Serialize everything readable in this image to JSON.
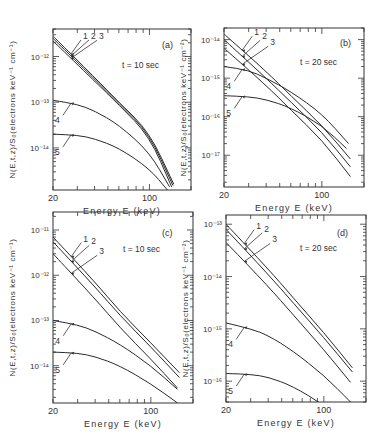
{
  "figure": {
    "ylabel": "N(E,t,z)/S₀(electrons keV⁻¹ cm⁻¹)",
    "ylabel_right": "N(E,t,z)/S₀(electrons keV⁻¹ cm⁻²)",
    "ylabel_c": "N(E,t,z)/S₀(elect",
    "ylabel_d": "N(E,t,z)/S₀(elec"
  },
  "chart_data": [
    {
      "type": "line",
      "panel": "(a)",
      "annotation": "t = 10 sec",
      "xlabel": "Energy E (keV)",
      "xscale": "log",
      "yscale": "log",
      "xlim": [
        20,
        200
      ],
      "ylim": [
        1.2e-15,
        4e-12
      ],
      "xticklabels": [
        "20",
        "100"
      ],
      "yticklabels": [
        "10⁻¹²",
        "10⁻¹³",
        "10⁻¹⁴"
      ],
      "yticks": [
        1e-12,
        1e-13,
        1e-14
      ],
      "series": [
        {
          "name": "1",
          "x": [
            20,
            40,
            60,
            100,
            150
          ],
          "y": [
            2.8e-12,
            3.5e-13,
            1e-13,
            2.2e-14,
            1.6e-15
          ]
        },
        {
          "name": "2",
          "x": [
            20,
            40,
            60,
            100,
            148
          ],
          "y": [
            2.5e-12,
            3.2e-13,
            9.5e-14,
            2e-14,
            1.5e-15
          ]
        },
        {
          "name": "3",
          "x": [
            20,
            40,
            60,
            100,
            145
          ],
          "y": [
            2.2e-12,
            2.9e-13,
            8.8e-14,
            1.8e-14,
            1.4e-15
          ]
        },
        {
          "name": "4",
          "x": [
            20,
            30,
            40,
            60,
            100,
            140
          ],
          "y": [
            1.1e-13,
            9e-14,
            6.5e-14,
            3.2e-14,
            8e-15,
            1.4e-15
          ]
        },
        {
          "name": "5",
          "x": [
            20,
            30,
            40,
            60,
            100,
            135
          ],
          "y": [
            2e-14,
            1.9e-14,
            1.6e-14,
            1e-14,
            3.5e-15,
            1.2e-15
          ]
        }
      ]
    },
    {
      "type": "line",
      "panel": "(b)",
      "annotation": "t = 20 sec",
      "xlabel": "Energy E (keV)",
      "xscale": "log",
      "yscale": "log",
      "xlim": [
        20,
        200
      ],
      "ylim": [
        1.5e-18,
        2e-14
      ],
      "xticklabels": [
        "20",
        "100"
      ],
      "yticklabels": [
        "10⁻¹⁴",
        "10⁻¹⁵",
        "10⁻¹⁶",
        "10⁻¹⁷"
      ],
      "yticks": [
        1e-14,
        1e-15,
        1e-16,
        1e-17
      ],
      "series": [
        {
          "name": "1",
          "x": [
            20,
            40,
            60,
            100,
            160
          ],
          "y": [
            1.4e-14,
            1.5e-15,
            3.5e-16,
            6e-17,
            8e-18
          ]
        },
        {
          "name": "2",
          "x": [
            20,
            40,
            60,
            100,
            160
          ],
          "y": [
            1e-14,
            1e-15,
            2.4e-16,
            4e-17,
            5e-18
          ]
        },
        {
          "name": "3",
          "x": [
            20,
            40,
            60,
            100,
            160
          ],
          "y": [
            6e-15,
            6.5e-16,
            1.5e-16,
            2.5e-17,
            2.8e-18
          ]
        },
        {
          "name": "4",
          "x": [
            20,
            30,
            40,
            60,
            100,
            155
          ],
          "y": [
            2e-15,
            1.6e-15,
            1e-15,
            4.5e-16,
            1.2e-16,
            2e-17
          ]
        },
        {
          "name": "5",
          "x": [
            20,
            30,
            40,
            60,
            100,
            150
          ],
          "y": [
            3.5e-16,
            3.3e-16,
            2.8e-16,
            1.7e-16,
            6e-17,
            1.5e-17
          ]
        }
      ]
    },
    {
      "type": "line",
      "panel": "(c)",
      "annotation": "t = 10 sec",
      "xlabel": "Energy E (keV)",
      "xscale": "log",
      "yscale": "log",
      "xlim": [
        20,
        200
      ],
      "ylim": [
        1.5e-15,
        2.5e-11
      ],
      "xticklabels": [
        "20",
        "100"
      ],
      "yticklabels": [
        "10⁻¹¹",
        "10⁻¹²",
        "10⁻¹³",
        "10⁻¹⁴"
      ],
      "yticks": [
        1e-11,
        1e-12,
        1e-13,
        1e-14
      ],
      "series": [
        {
          "name": "1",
          "x": [
            20,
            40,
            60,
            100,
            160
          ],
          "y": [
            7e-12,
            7e-13,
            1.6e-13,
            3.2e-14,
            7e-15
          ]
        },
        {
          "name": "2",
          "x": [
            20,
            40,
            60,
            100,
            160
          ],
          "y": [
            5.5e-12,
            5.5e-13,
            1.3e-13,
            2.6e-14,
            5.5e-15
          ]
        },
        {
          "name": "3",
          "x": [
            20,
            40,
            60,
            100,
            155
          ],
          "y": [
            3e-12,
            3e-13,
            7e-14,
            1.4e-14,
            3.2e-15
          ]
        },
        {
          "name": "4",
          "x": [
            20,
            30,
            40,
            60,
            100,
            155
          ],
          "y": [
            1e-13,
            8e-14,
            5.8e-14,
            3e-14,
            1e-14,
            3e-15
          ]
        },
        {
          "name": "5",
          "x": [
            20,
            30,
            40,
            60,
            100,
            155
          ],
          "y": [
            2e-14,
            1.9e-14,
            1.6e-14,
            1e-14,
            4e-15,
            1.5e-15
          ]
        }
      ]
    },
    {
      "type": "line",
      "panel": "(d)",
      "annotation": "t = 20 sec",
      "xlabel": "Energy E (keV)",
      "xscale": "log",
      "yscale": "log",
      "xlim": [
        20,
        200
      ],
      "ylim": [
        4e-17,
        1.5e-13
      ],
      "xticklabels": [
        "20",
        "100"
      ],
      "yticklabels": [
        "10⁻¹³",
        "10⁻¹⁴",
        "10⁻¹⁵",
        "10⁻¹⁶"
      ],
      "yticks": [
        1e-13,
        1e-14,
        1e-15,
        1e-16
      ],
      "series": [
        {
          "name": "1",
          "x": [
            20,
            40,
            60,
            100,
            160
          ],
          "y": [
            1e-13,
            1.4e-14,
            4e-15,
            8.5e-16,
            1.8e-16
          ]
        },
        {
          "name": "2",
          "x": [
            20,
            40,
            60,
            100,
            160
          ],
          "y": [
            8e-14,
            1.1e-14,
            3.2e-15,
            6.8e-16,
            1.5e-16
          ]
        },
        {
          "name": "3",
          "x": [
            20,
            40,
            60,
            100,
            155
          ],
          "y": [
            4.5e-14,
            6.5e-15,
            1.9e-15,
            4e-16,
            9.5e-17
          ]
        },
        {
          "name": "4",
          "x": [
            20,
            30,
            40,
            60,
            100,
            155
          ],
          "y": [
            1.3e-15,
            1e-15,
            7.5e-16,
            3.8e-16,
            1.3e-16,
            4e-17
          ]
        },
        {
          "name": "5",
          "x": [
            20,
            30,
            40,
            60,
            100,
            150
          ],
          "y": [
            1.4e-16,
            1.35e-16,
            1.2e-16,
            8e-17,
            3.5e-17,
            1.5e-17
          ]
        }
      ]
    }
  ]
}
